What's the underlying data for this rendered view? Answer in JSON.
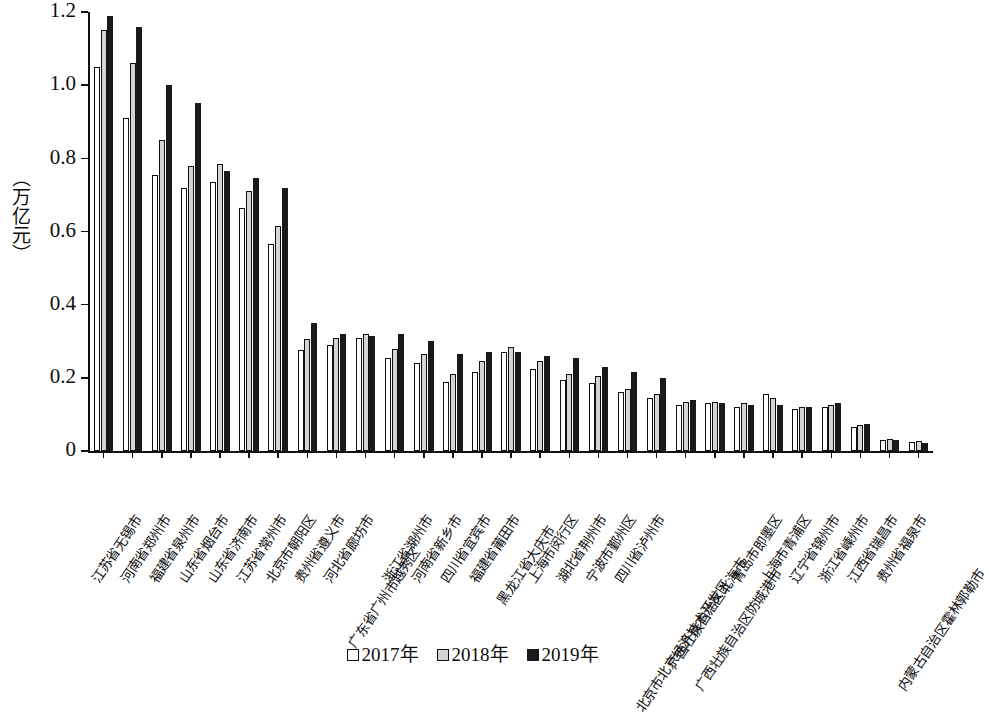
{
  "chart_data": {
    "type": "bar",
    "title": "",
    "subtitle": "",
    "xlabel": "",
    "ylabel": "（万亿元）",
    "ylim": [
      0,
      1.2
    ],
    "ytick_labels": [
      "0",
      "0.2",
      "0.4",
      "0.6",
      "0.8",
      "1.0",
      "1.2"
    ],
    "ytick_values": [
      0,
      0.2,
      0.4,
      0.6,
      0.8,
      1.0,
      1.2
    ],
    "grid": false,
    "legend_position": "bottom",
    "categories": [
      "江苏省无锡市",
      "河南省郑州市",
      "福建省泉州市",
      "山东省烟台市",
      "山东省济南市",
      "江苏省常州市",
      "北京市朝阳区",
      "贵州省遵义市",
      "河北省廊坊市",
      "广东省广州市越秀区",
      "浙江省湖州市",
      "河南省新乡市",
      "四川省宜宾市",
      "福建省莆田市",
      "黑龙江省大庆市",
      "上海市闵行区",
      "湖北省荆州市",
      "宁波市鄞州区",
      "四川省泸州市",
      "北京市北京经济技术开发区",
      "广西壮族自治区北海市",
      "广西壮族自治区防城港市",
      "青岛市即墨区",
      "上海市青浦区",
      "辽宁省锦州市",
      "浙江省嵊州市",
      "江西省瑞昌市",
      "贵州省福泉市",
      "内蒙古自治区霍林郭勒市"
    ],
    "series": [
      {
        "name": "2017年",
        "color": "#ffffff",
        "values": [
          1.05,
          0.91,
          0.755,
          0.72,
          0.735,
          0.665,
          0.565,
          0.275,
          0.29,
          0.31,
          0.255,
          0.24,
          0.19,
          0.215,
          0.27,
          0.225,
          0.195,
          0.185,
          0.16,
          0.145,
          0.125,
          0.13,
          0.12,
          0.155,
          0.115,
          0.12,
          0.065,
          0.03,
          0.025
        ]
      },
      {
        "name": "2018年",
        "color": "#d4d4d4",
        "values": [
          1.15,
          1.06,
          0.85,
          0.78,
          0.785,
          0.71,
          0.615,
          0.305,
          0.31,
          0.32,
          0.28,
          0.265,
          0.21,
          0.245,
          0.285,
          0.245,
          0.21,
          0.205,
          0.17,
          0.155,
          0.135,
          0.135,
          0.13,
          0.145,
          0.12,
          0.125,
          0.07,
          0.032,
          0.027
        ]
      },
      {
        "name": "2019年",
        "color": "#1a1a1a",
        "values": [
          1.19,
          1.16,
          1.0,
          0.95,
          0.765,
          0.745,
          0.72,
          0.35,
          0.32,
          0.315,
          0.32,
          0.3,
          0.265,
          0.27,
          0.27,
          0.26,
          0.255,
          0.23,
          0.215,
          0.2,
          0.14,
          0.13,
          0.125,
          0.125,
          0.12,
          0.13,
          0.075,
          0.03,
          0.023
        ]
      }
    ]
  },
  "legend": {
    "items": [
      {
        "label": "2017年"
      },
      {
        "label": "2018年"
      },
      {
        "label": "2019年"
      }
    ]
  }
}
